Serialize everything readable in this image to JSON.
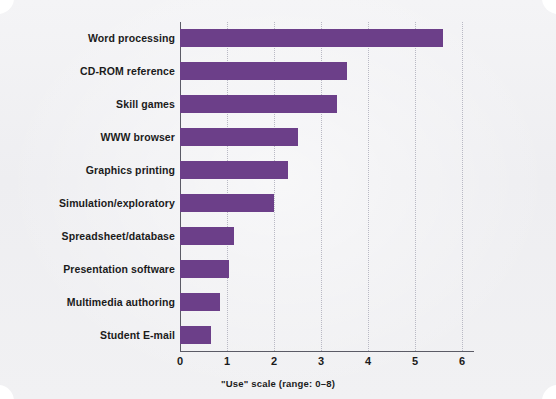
{
  "chart_data": {
    "type": "bar",
    "orientation": "horizontal",
    "title": "",
    "xlabel": "\"Use\" scale (range: 0–8)",
    "ylabel": "",
    "categories": [
      "Word processing",
      "CD-ROM reference",
      "Skill games",
      "WWW browser",
      "Graphics printing",
      "Simulation/exploratory",
      "Spreadsheet/database",
      "Presentation software",
      "Multimedia authoring",
      "Student E-mail"
    ],
    "values": [
      5.6,
      3.55,
      3.35,
      2.5,
      2.3,
      2.0,
      1.15,
      1.05,
      0.85,
      0.65
    ],
    "xlim": [
      0,
      6.4
    ],
    "xticks": [
      0,
      1,
      2,
      3,
      4,
      5,
      6
    ],
    "xtick_labels": [
      "0",
      "1",
      "2",
      "3",
      "4",
      "5",
      "6"
    ],
    "grid": "vertical-dotted",
    "legend": "none",
    "bar_color": "#6c3f89",
    "background_color": "#f1f1f4",
    "axis_color": "#5b5b66",
    "gridline_color": "#b9b9c4"
  },
  "caption": "\"Use\" scale (range: 0–8)"
}
